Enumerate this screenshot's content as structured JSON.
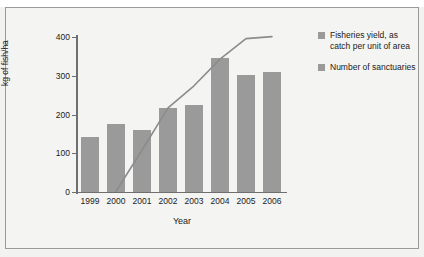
{
  "figure": {
    "partial_caption": "· ·   ·    · · ·",
    "background_color": "#f4f4f2",
    "border_color": "#9a9a9a"
  },
  "legend": {
    "position": "right",
    "items": [
      {
        "label": "Fisheries yield, as catch per unit of area",
        "swatch_color": "#9a9a9a",
        "marker": "square-swatch"
      },
      {
        "label": "Number of sanctuaries",
        "swatch_color": "#9a9a9a",
        "marker": "square-swatch"
      }
    ]
  },
  "chart_data": {
    "type": "bar",
    "title": "",
    "subtitle": "",
    "xlabel": "Year",
    "ylabel": "kg of fish/ha",
    "categories": [
      "1999",
      "2000",
      "2001",
      "2002",
      "2003",
      "2004",
      "2005",
      "2006"
    ],
    "ylim": [
      0,
      400
    ],
    "yticks": [
      0,
      100,
      200,
      300,
      400
    ],
    "grid": false,
    "legend_position": "right",
    "bar_color": "#9a9a9a",
    "line_color": "#8c8c8c",
    "series": [
      {
        "name": "Number of sanctuaries",
        "type": "bar",
        "values": [
          143,
          175,
          160,
          216,
          224,
          345,
          303,
          309
        ]
      },
      {
        "name": "Fisheries yield, as catch per unit of area",
        "type": "line",
        "values": [
          null,
          2,
          108,
          217,
          274,
          343,
          396,
          401
        ]
      }
    ]
  }
}
